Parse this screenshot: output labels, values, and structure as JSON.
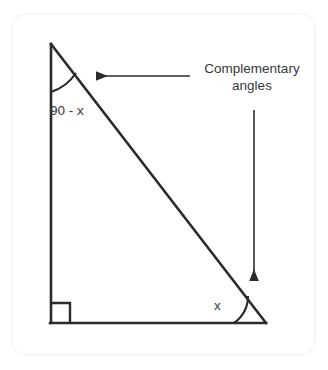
{
  "figure": {
    "card": {
      "background_color": "#ffffff",
      "border_color": "#f4f4f4"
    },
    "stroke_color": "#2b2b2b",
    "text_color": "#383838",
    "labels": {
      "apex_angle": "90 - x",
      "base_angle": "x",
      "callout_line1": "Complementary",
      "callout_line2": "angles"
    },
    "annotations": [
      {
        "name": "horizontal-arrow",
        "points_to": "apex-angle-arc",
        "direction": "left",
        "from_x": 190,
        "from_y": 76,
        "to_x": 93,
        "to_y": 76
      },
      {
        "name": "vertical-arrow",
        "points_to": "base-angle-arc",
        "direction": "down",
        "from_x": 254,
        "from_y": 110,
        "to_x": 254,
        "to_y": 284
      }
    ],
    "geometry": {
      "type": "right-triangle",
      "vertices": {
        "apex": [
          51,
          44
        ],
        "bottom_left": [
          51,
          323
        ],
        "bottom_right": [
          266,
          323
        ]
      },
      "right_angle_marker": {
        "at": "bottom_left",
        "size": 19
      },
      "angle_arcs": [
        {
          "at": "apex",
          "label": "90 - x",
          "radius": 32
        },
        {
          "at": "bottom_right",
          "label": "x",
          "radius": 32
        }
      ]
    }
  }
}
